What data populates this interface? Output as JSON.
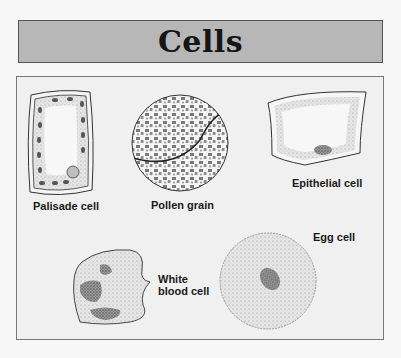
{
  "title": "Cells",
  "colors": {
    "background": "#f7f7f7",
    "title_box": "#b7b7b7",
    "panel": "#f0f0f0",
    "ink": "#1a1a1a"
  },
  "cells": [
    {
      "name": "palisade-cell",
      "label": "Palisade cell"
    },
    {
      "name": "pollen-grain",
      "label": "Pollen grain"
    },
    {
      "name": "epithelial-cell",
      "label": "Epithelial cell"
    },
    {
      "name": "white-blood-cell",
      "label_line1": "White",
      "label_line2": "blood cell"
    },
    {
      "name": "egg-cell",
      "label": "Egg cell"
    }
  ]
}
